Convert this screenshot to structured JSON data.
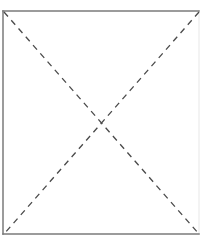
{
  "diagram": {
    "type": "rectangle-with-crossed-diagonals",
    "frame": {
      "left": 3,
      "top": 11,
      "right": 199,
      "bottom": 234,
      "stroke": "#7a7a7a",
      "stroke_width": 1.5
    },
    "diagonals": [
      {
        "name": "diagonal-top-left-to-bottom-right",
        "x1": 4,
        "y1": 12,
        "x2": 199,
        "y2": 234,
        "style": "dashed"
      },
      {
        "name": "diagonal-top-right-to-bottom-left",
        "x1": 199,
        "y1": 12,
        "x2": 4,
        "y2": 234,
        "style": "dashed"
      }
    ],
    "dash_stroke": "#4a4a4a",
    "dash_pattern": "6,5",
    "intersection": {
      "x": 101,
      "y": 123
    }
  }
}
